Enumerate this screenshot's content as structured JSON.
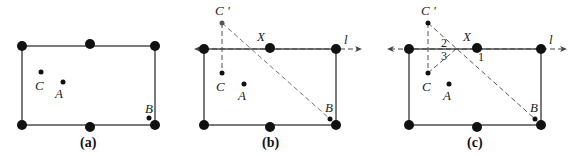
{
  "panels": [
    {
      "caption": "(a)",
      "points": {
        "C": "C",
        "A": "A",
        "B": "B"
      }
    },
    {
      "caption": "(b)",
      "points": {
        "C": "C",
        "A": "A",
        "B": "B",
        "C_prime": "C '",
        "X": "X"
      },
      "line_label": "l"
    },
    {
      "caption": "(c)",
      "points": {
        "C": "C",
        "A": "A",
        "B": "B",
        "C_prime": "C '",
        "X": "X"
      },
      "line_label": "l",
      "angles": [
        "1",
        "2",
        "3"
      ]
    }
  ],
  "colors": {
    "ink": "#111111",
    "dashed": "#555555",
    "background": "#ffffff"
  }
}
